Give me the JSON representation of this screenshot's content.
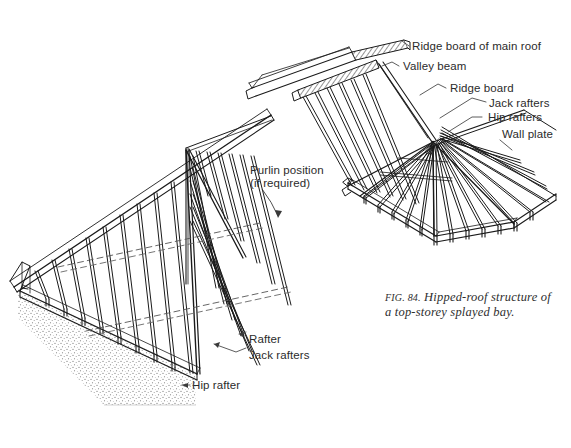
{
  "figure": {
    "caption_label": "FIG. 84.",
    "caption_text": "Hipped-roof structure of a top-storey splayed bay.",
    "background_color": "#ffffff",
    "line_color": "#1a1a1a",
    "text_color": "#2b2b2b"
  },
  "callouts": {
    "ridge_board_main_roof": "Ridge board of main roof",
    "valley_beam": "Valley beam",
    "ridge_board": "Ridge board",
    "jack_rafters_right": "Jack rafters",
    "hip_rafters": "Hip rafters",
    "wall_plate": "Wall plate",
    "purlin_position_line1": "Purlin position",
    "purlin_position_line2": "(if required)",
    "rafter": "Rafter",
    "jack_rafters_left": "Jack rafters",
    "hip_rafter": "Hip rafter"
  },
  "diagram_parts": {
    "main_roof_slope": "main-roof-slope",
    "hipped_end": "hipped-end",
    "splayed_bay": "splayed-bay",
    "masonry_wall": "masonry-wall",
    "purlin_dashed_lines": "purlin-dashed-lines"
  }
}
